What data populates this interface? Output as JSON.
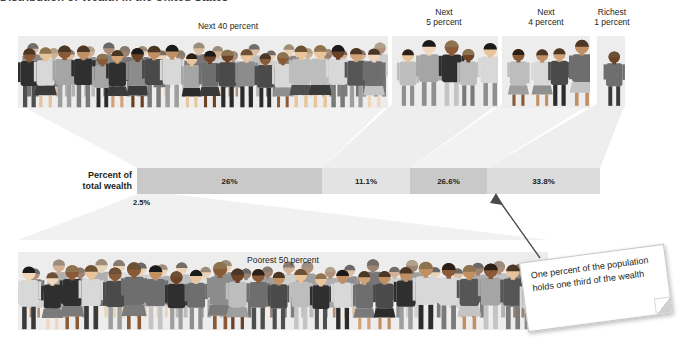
{
  "figure": {
    "title": "Distribution of Wealth in the United States"
  },
  "top_groups": [
    {
      "id": "next40",
      "label": "Next 40 percent",
      "people": 40
    },
    {
      "id": "next5",
      "label": "Next\n5 percent",
      "people": 5
    },
    {
      "id": "next4",
      "label": "Next\n4 percent",
      "people": 4
    },
    {
      "id": "richest1",
      "label": "Richest\n1 percent",
      "people": 1
    }
  ],
  "bottom_group": {
    "id": "poorest50",
    "label": "Poorest 50 percent",
    "people": 50
  },
  "bar": {
    "caption": "Percent of\ntotal wealth",
    "caption_line1": "Percent of",
    "caption_line2": "total wealth",
    "outside_label": "2.5%"
  },
  "callout": {
    "text": "One percent of the population holds one third of the wealth"
  },
  "colors": {
    "panel_fill": "#ededed",
    "seg_dark": "#c9c9c9",
    "seg_light": "#e3e3e3",
    "wedge": "#f1f1f1",
    "text": "#231f20"
  },
  "chart_data": {
    "type": "bar",
    "title": "Distribution of Wealth in the United States",
    "orientation": "horizontal-stacked",
    "xlabel": "",
    "ylabel": "Percent of total wealth",
    "categories": [
      "Poorest 50 percent",
      "Next 40 percent",
      "Next 5 percent",
      "Next 4 percent",
      "Richest 1 percent"
    ],
    "values": [
      2.5,
      26,
      11.1,
      26.6,
      33.8
    ],
    "value_labels": [
      "2.5%",
      "26%",
      "11.1%",
      "26.6%",
      "33.8%"
    ],
    "population_shares": [
      50,
      40,
      5,
      4,
      1
    ],
    "grid": false,
    "legend": "none",
    "annotations": [
      "One percent of the population holds one third of the wealth"
    ]
  }
}
